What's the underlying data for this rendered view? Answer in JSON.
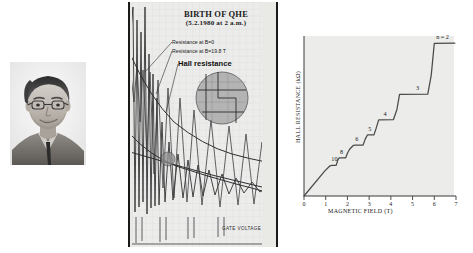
{
  "figure": {
    "panels": [
      "portrait",
      "original-notebook-chart",
      "hall-resistance-chart"
    ]
  },
  "portrait": {
    "alt": "black-and-white portrait photograph of a man with glasses"
  },
  "notebook": {
    "title_line1": "BIRTH OF QHE",
    "title_line2": "(5.2.1980 at 2 a.m.)",
    "annotations": {
      "resistance_b0": "Resistance at B=0",
      "resistance_b198": "Resistance at B=19.8 T",
      "hall_resistance": "Hall resistance"
    },
    "xlabel": "GATE VOLTAGE"
  },
  "chart_data": {
    "type": "line",
    "title": "",
    "xlabel": "MAGNETIC FIELD (T)",
    "ylabel": "HALL RESISTANCE (kΩ)",
    "xlim": [
      0,
      7
    ],
    "ylim": [
      0,
      13.5
    ],
    "xticks": [
      0,
      1,
      2,
      3,
      4,
      5,
      6,
      7
    ],
    "xticklabels": [
      "0",
      "1",
      "2",
      "3",
      "4",
      "5",
      "6",
      "7"
    ],
    "yticks": [],
    "grid": false,
    "legend": null,
    "annotations": [
      {
        "label": "10",
        "x": 1.35,
        "y": 2.58
      },
      {
        "label": "8",
        "x": 1.75,
        "y": 3.23
      },
      {
        "label": "6",
        "x": 2.45,
        "y": 4.3
      },
      {
        "label": "5",
        "x": 3.05,
        "y": 5.16
      },
      {
        "label": "4",
        "x": 3.75,
        "y": 6.45
      },
      {
        "label": "3",
        "x": 5.25,
        "y": 8.6
      },
      {
        "label": "n = 2",
        "x": 6.5,
        "y": 12.9
      }
    ],
    "series": [
      {
        "name": "Hall resistance",
        "color": "#4a4a4a",
        "x": [
          0.0,
          0.95,
          1.2,
          1.28,
          1.48,
          1.56,
          1.62,
          1.92,
          2.0,
          2.1,
          2.28,
          2.36,
          2.72,
          2.82,
          2.92,
          3.22,
          3.32,
          3.44,
          4.12,
          4.28,
          4.4,
          5.7,
          5.86,
          6.0,
          6.95
        ],
        "y": [
          0.0,
          2.1,
          2.55,
          2.58,
          2.58,
          3.05,
          3.22,
          3.22,
          3.6,
          3.95,
          4.28,
          4.3,
          4.3,
          4.8,
          5.15,
          5.16,
          5.7,
          6.42,
          6.45,
          7.3,
          8.58,
          8.6,
          10.2,
          12.88,
          12.9
        ]
      }
    ]
  }
}
